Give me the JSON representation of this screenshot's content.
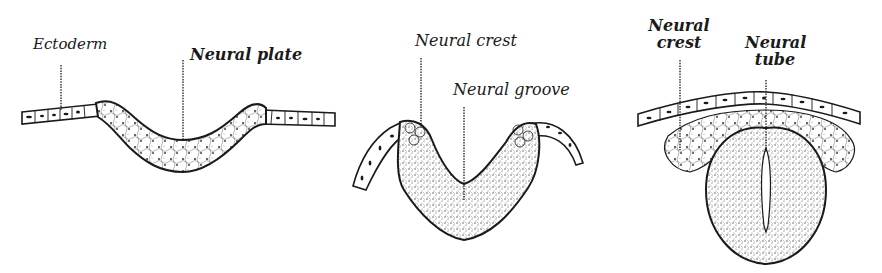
{
  "figure": {
    "panels": [
      {
        "id": "stage-1",
        "labels": [
          {
            "text": "Ectoderm"
          },
          {
            "text": "Neural plate"
          }
        ]
      },
      {
        "id": "stage-2",
        "labels": [
          {
            "text": "Neural crest"
          },
          {
            "text": "Neural groove"
          }
        ]
      },
      {
        "id": "stage-3",
        "labels": [
          {
            "line1": "Neural",
            "line2": "crest"
          },
          {
            "line1": "Neural",
            "line2": "tube"
          }
        ]
      }
    ],
    "colors": {
      "ink": "#1a1a1a",
      "background": "#ffffff",
      "stipple": "#555555"
    }
  }
}
